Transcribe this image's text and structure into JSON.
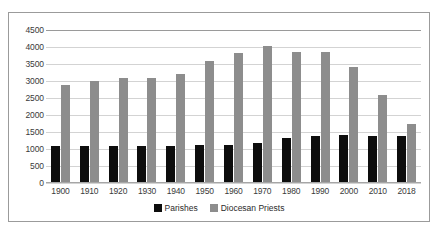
{
  "chart_data": {
    "type": "bar",
    "title": "",
    "subtitle": "",
    "xlabel": "",
    "ylabel": "",
    "ylim": [
      0,
      4500
    ],
    "ytick_step": 500,
    "grid": true,
    "legend_position": "bottom-center",
    "categories": [
      "1900",
      "1910",
      "1920",
      "1930",
      "1940",
      "1950",
      "1960",
      "1970",
      "1980",
      "1990",
      "2000",
      "2010",
      "2018"
    ],
    "yticks": [
      "0",
      "500",
      "1000",
      "1500",
      "2000",
      "2500",
      "3000",
      "3500",
      "4000",
      "4500"
    ],
    "series": [
      {
        "name": "Parishes",
        "color": "#0d0d0d",
        "values": [
          1090,
          1090,
          1090,
          1090,
          1090,
          1110,
          1120,
          1180,
          1310,
          1380,
          1400,
          1390,
          1380
        ]
      },
      {
        "name": "Diocesan Priests",
        "color": "#8d8d8d",
        "values": [
          2890,
          3000,
          3080,
          3080,
          3200,
          3580,
          3830,
          4030,
          3840,
          3840,
          3410,
          2600,
          1750
        ]
      }
    ]
  },
  "legend": {
    "items": [
      {
        "label": "Parishes",
        "color": "#0d0d0d"
      },
      {
        "label": "Diocesan Priests",
        "color": "#8d8d8d"
      }
    ]
  }
}
